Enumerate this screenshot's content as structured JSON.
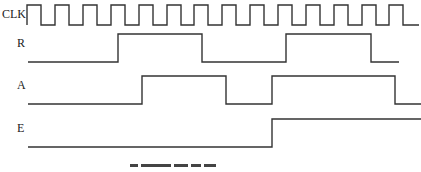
{
  "diagram": {
    "type": "timing-diagram",
    "signals": [
      {
        "name": "CLK",
        "label_pos": [
          2,
          8
        ],
        "high_y": 5,
        "low_y": 25,
        "points": [
          [
            27,
            25
          ],
          [
            27,
            5
          ],
          [
            41,
            5
          ],
          [
            41,
            25
          ],
          [
            55,
            25
          ],
          [
            55,
            5
          ],
          [
            69,
            5
          ],
          [
            69,
            25
          ],
          [
            83,
            25
          ],
          [
            83,
            5
          ],
          [
            97,
            5
          ],
          [
            97,
            25
          ],
          [
            111,
            25
          ],
          [
            111,
            5
          ],
          [
            125,
            5
          ],
          [
            125,
            25
          ],
          [
            139,
            25
          ],
          [
            139,
            5
          ],
          [
            153,
            5
          ],
          [
            153,
            25
          ],
          [
            167,
            25
          ],
          [
            167,
            5
          ],
          [
            181,
            5
          ],
          [
            181,
            25
          ],
          [
            194,
            25
          ],
          [
            194,
            5
          ],
          [
            208,
            5
          ],
          [
            208,
            25
          ],
          [
            222,
            25
          ],
          [
            222,
            5
          ],
          [
            236,
            5
          ],
          [
            236,
            25
          ],
          [
            250,
            25
          ],
          [
            250,
            5
          ],
          [
            264,
            5
          ],
          [
            264,
            25
          ],
          [
            278,
            25
          ],
          [
            278,
            5
          ],
          [
            292,
            5
          ],
          [
            292,
            25
          ],
          [
            306,
            25
          ],
          [
            306,
            5
          ],
          [
            320,
            5
          ],
          [
            320,
            25
          ],
          [
            334,
            25
          ],
          [
            334,
            5
          ],
          [
            348,
            5
          ],
          [
            348,
            25
          ],
          [
            362,
            25
          ],
          [
            362,
            5
          ],
          [
            376,
            5
          ],
          [
            376,
            25
          ],
          [
            389,
            25
          ],
          [
            389,
            5
          ],
          [
            403,
            5
          ],
          [
            403,
            25
          ],
          [
            419,
            25
          ]
        ]
      },
      {
        "name": "R",
        "label_pos": [
          17,
          42
        ],
        "high_y": 34,
        "low_y": 62,
        "points": [
          [
            28,
            62
          ],
          [
            118,
            62
          ],
          [
            118,
            34
          ],
          [
            202,
            34
          ],
          [
            202,
            62
          ],
          [
            286,
            62
          ],
          [
            286,
            34
          ],
          [
            371,
            34
          ],
          [
            371,
            62
          ],
          [
            399,
            62
          ]
        ]
      },
      {
        "name": "A",
        "label_pos": [
          17,
          84
        ],
        "high_y": 76,
        "low_y": 104,
        "points": [
          [
            28,
            104
          ],
          [
            142,
            104
          ],
          [
            142,
            76
          ],
          [
            226,
            76
          ],
          [
            226,
            104
          ],
          [
            272,
            104
          ],
          [
            272,
            76
          ],
          [
            395,
            76
          ],
          [
            395,
            104
          ],
          [
            421,
            104
          ]
        ]
      },
      {
        "name": "E",
        "label_pos": [
          17,
          127
        ],
        "high_y": 119,
        "low_y": 147,
        "points": [
          [
            28,
            147
          ],
          [
            272,
            147
          ],
          [
            272,
            119
          ],
          [
            421,
            119
          ]
        ]
      }
    ],
    "caption": "(truncated caption, illegible)"
  },
  "labels": {
    "clk": "CLK",
    "r": "R",
    "a": "A",
    "e": "E"
  }
}
